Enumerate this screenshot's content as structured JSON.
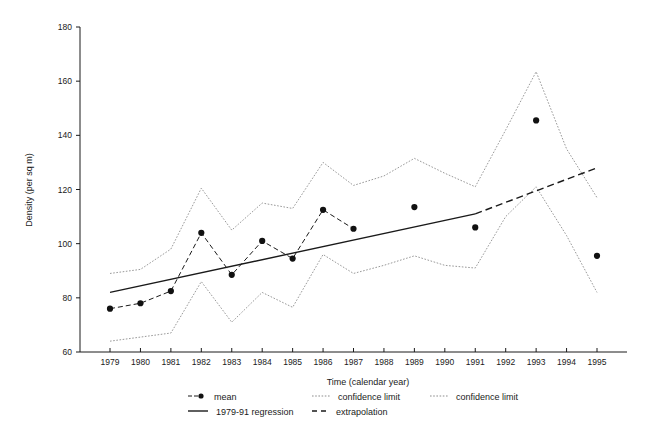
{
  "chart_data": {
    "type": "line",
    "title": "",
    "xlabel": "Time (calendar year)",
    "ylabel": "Density (per sq m)",
    "xlim": [
      1978.5,
      1995.8
    ],
    "ylim": [
      60,
      180
    ],
    "ytick_values": [
      60,
      80,
      100,
      120,
      140,
      160,
      180
    ],
    "ytick_labels": [
      "60",
      "80",
      "100",
      "120",
      "140",
      "160",
      "180"
    ],
    "xtick_values": [
      1979,
      1980,
      1981,
      1982,
      1983,
      1984,
      1985,
      1986,
      1987,
      1988,
      1989,
      1990,
      1991,
      1992,
      1993,
      1994,
      1995
    ],
    "xtick_labels": [
      "1979",
      "1980",
      "1981",
      "1982",
      "1983",
      "1984",
      "1985",
      "1986",
      "1987",
      "1988",
      "1989",
      "1990",
      "1991",
      "1992",
      "1993",
      "1994",
      "1995"
    ],
    "grid": false,
    "legend_position": "bottom",
    "categories": [
      1979,
      1980,
      1981,
      1982,
      1983,
      1984,
      1985,
      1986,
      1987,
      1988,
      1989,
      1990,
      1991,
      1992,
      1993,
      1994,
      1995
    ],
    "series": [
      {
        "name": "mean",
        "style": "markers-dashed",
        "x": [
          1979,
          1980,
          1981,
          1982,
          1983,
          1984,
          1985,
          1986,
          1987
        ],
        "values": [
          76,
          78,
          82.5,
          104,
          88.5,
          101,
          94.5,
          112.5,
          105.5
        ]
      },
      {
        "name": "mean-unconnected",
        "style": "markers",
        "x": [
          1989,
          1991,
          1993,
          1995
        ],
        "values": [
          113.5,
          106,
          145.5,
          95.5
        ]
      },
      {
        "name": "confidence limit",
        "style": "dotted-upper",
        "x": [
          1979,
          1980,
          1981,
          1982,
          1983,
          1984,
          1985,
          1986,
          1987,
          1988,
          1989,
          1990,
          1991,
          1992,
          1993,
          1994,
          1995
        ],
        "values": [
          89,
          90.5,
          98,
          120.5,
          105,
          115,
          113,
          130,
          121.5,
          125,
          131.5,
          126,
          121,
          142,
          163.5,
          135,
          117
        ]
      },
      {
        "name": "confidence limit",
        "style": "dotted-lower",
        "x": [
          1979,
          1980,
          1981,
          1982,
          1983,
          1984,
          1985,
          1986,
          1987,
          1988,
          1989,
          1990,
          1991,
          1992,
          1993,
          1994,
          1995
        ],
        "values": [
          64,
          65.5,
          67,
          86,
          71,
          82,
          76.5,
          96,
          89,
          92,
          95.5,
          92,
          91,
          110,
          121,
          103,
          82
        ]
      },
      {
        "name": "1979-91 regression",
        "style": "solid",
        "x": [
          1979,
          1991
        ],
        "values": [
          82,
          111
        ]
      },
      {
        "name": "extrapolation",
        "style": "dashed",
        "x": [
          1991,
          1995
        ],
        "values": [
          111,
          128
        ]
      }
    ],
    "legend": [
      {
        "label": "mean",
        "marker": "dot-dash"
      },
      {
        "label": "confidence limit",
        "marker": "dotted"
      },
      {
        "label": "confidence limit",
        "marker": "dotted"
      },
      {
        "label": "1979-91 regression",
        "marker": "solid"
      },
      {
        "label": "extrapolation",
        "marker": "dashed"
      }
    ],
    "colors": {
      "mean": "#111111",
      "confidence_limit": "#8d8d8d",
      "regression": "#1a1a1a",
      "extrapolation": "#1a1a1a",
      "axis": "#1a1a1a",
      "background": "#ffffff"
    }
  }
}
